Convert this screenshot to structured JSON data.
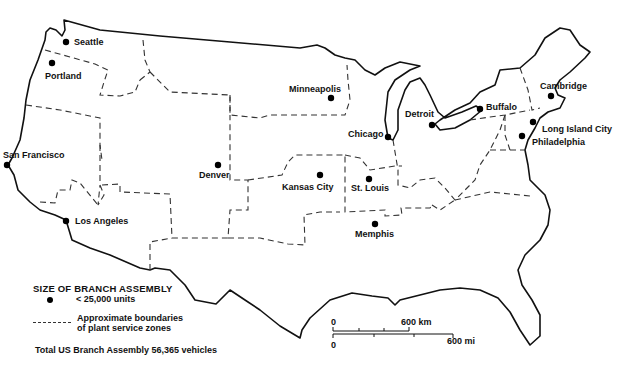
{
  "map": {
    "title": "US Branch Assembly Plants and Service Zones",
    "cities": [
      {
        "name": "Seattle",
        "x": 66,
        "y": 42
      },
      {
        "name": "Portland",
        "x": 52,
        "y": 64
      },
      {
        "name": "Minneapolis",
        "x": 331,
        "y": 98
      },
      {
        "name": "Detroit",
        "x": 432,
        "y": 126
      },
      {
        "name": "Chicago",
        "x": 388,
        "y": 136
      },
      {
        "name": "Buffalo",
        "x": 480,
        "y": 109
      },
      {
        "name": "Cambridge",
        "x": 551,
        "y": 96
      },
      {
        "name": "Long Island City",
        "x": 533,
        "y": 122
      },
      {
        "name": "Philadelphia",
        "x": 522,
        "y": 136
      },
      {
        "name": "San Francisco",
        "x": 7,
        "y": 165
      },
      {
        "name": "Denver",
        "x": 218,
        "y": 165
      },
      {
        "name": "Kansas City",
        "x": 320,
        "y": 175
      },
      {
        "name": "St. Louis",
        "x": 369,
        "y": 179
      },
      {
        "name": "Los Angeles",
        "x": 66,
        "y": 221
      },
      {
        "name": "Memphis",
        "x": 375,
        "y": 224
      }
    ]
  },
  "labels": {
    "seattle": "Seattle",
    "portland": "Portland",
    "minneapolis": "Minneapolis",
    "detroit": "Detroit",
    "chicago": "Chicago",
    "buffalo": "Buffalo",
    "cambridge": "Cambridge",
    "long_island_city": "Long Island City",
    "philadelphia": "Philadelphia",
    "san_francisco": "San Francisco",
    "denver": "Denver",
    "kansas_city": "Kansas City",
    "st_louis": "St. Louis",
    "los_angeles": "Los Angeles",
    "memphis": "Memphis"
  },
  "legend": {
    "title": "SIZE OF BRANCH ASSEMBLY",
    "dot_label": "< 25,000 units",
    "dash_label_line1": "Approximate boundaries",
    "dash_label_line2": "of plant service zones",
    "total": "Total US Branch Assembly 56,365 vehicles"
  },
  "scale": {
    "km_zero": "0",
    "km_label": "600 km",
    "mi_zero": "0",
    "mi_label": "600 mi"
  }
}
